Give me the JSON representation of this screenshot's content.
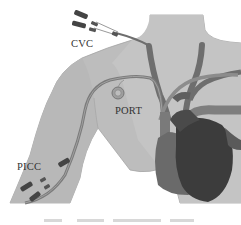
{
  "figure": {
    "labels": {
      "cvc": "CVC",
      "port": "PORT",
      "picc": "PICC"
    },
    "caption": {
      "text": "",
      "note": "caption line present but cut off / illegible"
    },
    "colors": {
      "background": "#ffffff",
      "skin": "#bdbdbd",
      "skin_outline": "#9a9a9a",
      "vein": "#6e6e6e",
      "catheter": "#8a8a8a",
      "heart_dark": "#3a3a3a",
      "heart_mid": "#5a5a5a",
      "vessel_light": "#909090",
      "text": "#333333"
    }
  }
}
